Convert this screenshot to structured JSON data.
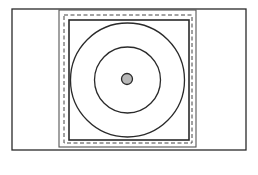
{
  "diagram": {
    "colors": {
      "background": "#ffffff",
      "stroke": "#2a2a2a",
      "frame_stroke": "#555555",
      "dash_stroke": "#444444",
      "center_fill": "#b8b8b8"
    },
    "outer_rectangle": {
      "x": 12,
      "y": 9,
      "width": 234,
      "height": 141
    },
    "frame": {
      "x": 59,
      "y": 10,
      "width": 137,
      "height": 137
    },
    "dashed_border": {
      "x": 64,
      "y": 15,
      "width": 128,
      "height": 128
    },
    "inner_square": {
      "x": 69,
      "y": 20,
      "width": 120,
      "height": 120
    },
    "circles": [
      {
        "name": "outer-circle",
        "cx": 127.5,
        "cy": 80,
        "r": 57
      },
      {
        "name": "inner-circle",
        "cx": 127.5,
        "cy": 80,
        "r": 33
      }
    ],
    "center_dot": {
      "cx": 127,
      "cy": 79,
      "r": 5.5
    }
  }
}
